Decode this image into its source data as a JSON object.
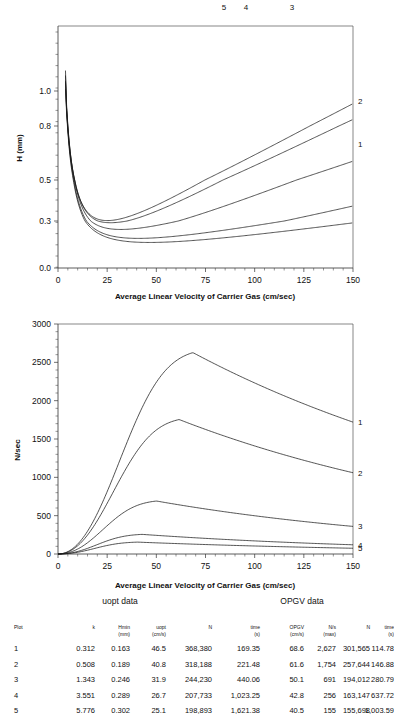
{
  "chart_data": [
    {
      "id": "plate-height-chart",
      "type": "line",
      "title": "",
      "xlabel": "Average Linear Velocity of Carrier Gas (cm/sec)",
      "ylabel": "H (mm)",
      "xlim": [
        0,
        150
      ],
      "ylim": [
        0.0,
        1.15
      ],
      "yscale": "log-like",
      "xticks": [
        0,
        25,
        50,
        75,
        100,
        125,
        150
      ],
      "xticklabels": [
        "0",
        "25",
        "50",
        "75",
        "100",
        "125",
        "150"
      ],
      "yticks": [
        0.0,
        0.3,
        0.5,
        0.8,
        1.0
      ],
      "yticklabels": [
        "0.0",
        "0.3",
        "0.5",
        "0.8",
        "1.0"
      ],
      "grid": false,
      "legend_position": "curve-end-labels",
      "series": [
        {
          "name": "1",
          "k": 0.312,
          "Hmin": 0.163,
          "uopt": 46.5
        },
        {
          "name": "2",
          "k": 0.508,
          "Hmin": 0.189,
          "uopt": 40.8
        },
        {
          "name": "3",
          "k": 1.343,
          "Hmin": 0.246,
          "uopt": 31.9
        },
        {
          "name": "4",
          "k": 3.551,
          "Hmin": 0.289,
          "uopt": 26.7
        },
        {
          "name": "5",
          "k": 5.776,
          "Hmin": 0.302,
          "uopt": 25.1
        }
      ],
      "curve_labels": [
        "5",
        "4",
        "3",
        "2",
        "1"
      ]
    },
    {
      "id": "plates-per-second-chart",
      "type": "line",
      "title": "",
      "xlabel": "Average Linear Velocity of Carrier Gas (cm/sec)",
      "ylabel": "N/sec",
      "xlim": [
        0,
        150
      ],
      "ylim": [
        0,
        3000
      ],
      "xticks": [
        0,
        25,
        50,
        75,
        100,
        125,
        150
      ],
      "xticklabels": [
        "0",
        "25",
        "50",
        "75",
        "100",
        "125",
        "150"
      ],
      "yticks": [
        0,
        500,
        1000,
        1500,
        2000,
        2500,
        3000
      ],
      "yticklabels": [
        "0",
        "500",
        "1000",
        "1500",
        "2000",
        "2500",
        "3000"
      ],
      "grid": false,
      "legend_position": "curve-end-labels",
      "series": [
        {
          "name": "1",
          "peak_x": 68.6,
          "peak_y": 2627,
          "end_y": 1720
        },
        {
          "name": "2",
          "peak_x": 61.6,
          "peak_y": 1754,
          "end_y": 1060
        },
        {
          "name": "3",
          "peak_x": 50.1,
          "peak_y": 691,
          "end_y": 360
        },
        {
          "name": "4",
          "peak_x": 42.8,
          "peak_y": 256,
          "end_y": 120
        },
        {
          "name": "5",
          "peak_x": 40.5,
          "peak_y": 155,
          "end_y": 75
        }
      ],
      "curve_labels": [
        "1",
        "2",
        "3",
        "4",
        "5"
      ]
    }
  ],
  "table": {
    "group_headers": [
      {
        "label": "uopt data"
      },
      {
        "label": "OPGV data"
      }
    ],
    "columns": [
      {
        "line1": "Plot",
        "line2": ""
      },
      {
        "line1": "k",
        "line2": ""
      },
      {
        "line1": "Hmin",
        "line2": "(mm)"
      },
      {
        "line1": "uopt",
        "line2": "(cm/s)"
      },
      {
        "line1": "N",
        "line2": ""
      },
      {
        "line1": "time",
        "line2": "(s)"
      },
      {
        "line1": "OPGV",
        "line2": "(cm/s)"
      },
      {
        "line1": "N/s",
        "line2": "(max)"
      },
      {
        "line1": "N",
        "line2": ""
      },
      {
        "line1": "time",
        "line2": "(s)"
      }
    ],
    "rows": [
      [
        "1",
        "0.312",
        "0.163",
        "46.5",
        "368,380",
        "169.35",
        "68.6",
        "2,627",
        "301,565",
        "114.78"
      ],
      [
        "2",
        "0.508",
        "0.189",
        "40.8",
        "318,188",
        "221.48",
        "61.6",
        "1,754",
        "257,644",
        "146.88"
      ],
      [
        "3",
        "1.343",
        "0.246",
        "31.9",
        "244,230",
        "440.06",
        "50.1",
        "691",
        "194,012",
        "280.79"
      ],
      [
        "4",
        "3.551",
        "0.289",
        "26.7",
        "207,733",
        "1,023.25",
        "42.8",
        "256",
        "163,147",
        "637.72"
      ],
      [
        "5",
        "5.776",
        "0.302",
        "25.1",
        "198,893",
        "1,621.38",
        "40.5",
        "155",
        "155,698",
        "1,003.59"
      ]
    ]
  },
  "colors": {
    "curve": "#1a1a1a",
    "axis": "#333333",
    "frame": "#555555",
    "background": "#ffffff"
  }
}
